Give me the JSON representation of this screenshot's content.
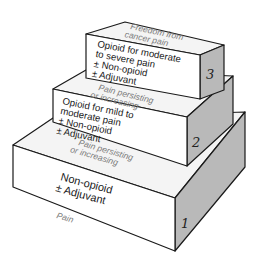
{
  "diagram": {
    "colors": {
      "front": "#ffffff",
      "top": "#f4f4f4",
      "side": "#b9b9b9",
      "stroke": "#1a1a1a",
      "label_gray": "#7a7a7a"
    },
    "entry_label": "Pain",
    "steps": [
      {
        "number": "1",
        "lines": [
          "Non-opioid",
          "± Adjuvant"
        ],
        "top_label": [
          "Pain persisting",
          "or increasing"
        ]
      },
      {
        "number": "2",
        "lines": [
          "Opioid for mild to",
          "moderate pain",
          "± Non-opioid",
          "± Adjuvant"
        ],
        "top_label": [
          "Pain persisting",
          "or increasing"
        ]
      },
      {
        "number": "3",
        "lines": [
          "Opioid for moderate",
          "to severe pain",
          "± Non-opioid",
          "± Adjuvant"
        ],
        "top_label": [
          "Freedom from",
          "cancer pain"
        ]
      }
    ]
  }
}
